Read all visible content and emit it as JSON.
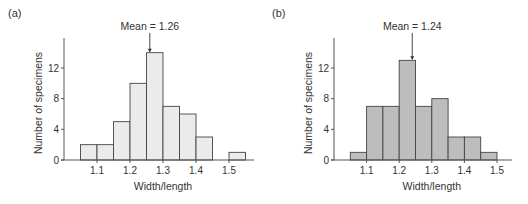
{
  "chart_data": [
    {
      "type": "bar",
      "panel_label": "(a)",
      "title": "",
      "xlabel": "Width/length",
      "ylabel": "Number of specimens",
      "bin_edges": [
        1.05,
        1.1,
        1.15,
        1.2,
        1.25,
        1.3,
        1.35,
        1.4,
        1.45,
        1.5,
        1.55
      ],
      "categories": [
        "1.05-1.10",
        "1.10-1.15",
        "1.15-1.20",
        "1.20-1.25",
        "1.25-1.30",
        "1.30-1.35",
        "1.35-1.40",
        "1.40-1.45",
        "1.45-1.50",
        "1.50-1.55"
      ],
      "values": [
        2,
        2,
        5,
        10,
        14,
        7,
        6,
        3,
        0,
        1
      ],
      "xticks": [
        "1.1",
        "1.2",
        "1.3",
        "1.4",
        "1.5"
      ],
      "yticks": [
        "0",
        "4",
        "8",
        "12"
      ],
      "ylim": [
        0,
        16
      ],
      "annotation": "Mean = 1.26",
      "mean": 1.26,
      "bar_color": "#ebebeb",
      "grid": false
    },
    {
      "type": "bar",
      "panel_label": "(b)",
      "title": "",
      "xlabel": "Width/length",
      "ylabel": "Number of specimens",
      "bin_edges": [
        1.05,
        1.1,
        1.15,
        1.2,
        1.25,
        1.3,
        1.35,
        1.4,
        1.45,
        1.5
      ],
      "categories": [
        "1.05-1.10",
        "1.10-1.15",
        "1.15-1.20",
        "1.20-1.25",
        "1.25-1.30",
        "1.30-1.35",
        "1.35-1.40",
        "1.40-1.45",
        "1.45-1.50"
      ],
      "values": [
        1,
        7,
        7,
        13,
        7,
        8,
        3,
        3,
        1
      ],
      "xticks": [
        "1.1",
        "1.2",
        "1.3",
        "1.4",
        "1.5"
      ],
      "yticks": [
        "0",
        "4",
        "8",
        "12"
      ],
      "ylim": [
        0,
        16
      ],
      "annotation": "Mean = 1.24",
      "mean": 1.24,
      "bar_color": "#bdbdbd",
      "grid": false
    }
  ]
}
